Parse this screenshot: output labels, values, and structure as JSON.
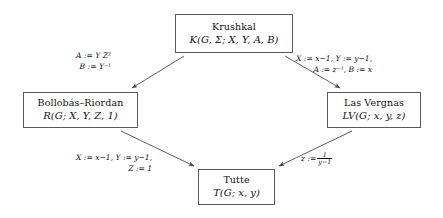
{
  "diagram": {
    "nodes": [
      {
        "id": "krushkal",
        "name": "Krushkal",
        "formula": "K(G, Σ; X, Y, A, B)"
      },
      {
        "id": "bollobas-riordan",
        "name": "Bollobás–Riordan",
        "formula": "R(G; X, Y, Z, 1)"
      },
      {
        "id": "las-vergnas",
        "name": "Las Vergnas",
        "formula": "LV(G; x, y, z)"
      },
      {
        "id": "tutte",
        "name": "Tutte",
        "formula": "T(G; x, y)"
      }
    ],
    "edges": [
      {
        "id": "krushkal-to-bollobas-riordan",
        "from": "krushkal",
        "to": "bollobas-riordan",
        "line1": "A := Y Z²",
        "line2": "B := Y⁻¹"
      },
      {
        "id": "krushkal-to-las-vergnas",
        "from": "krushkal",
        "to": "las-vergnas",
        "line1": "X := x−1,  Y := y−1,",
        "line2": "A := z⁻¹,  B := x"
      },
      {
        "id": "bollobas-riordan-to-tutte",
        "from": "bollobas-riordan",
        "to": "tutte",
        "line1": "X := x−1,  Y := y−1,",
        "line2": "Z := 1"
      },
      {
        "id": "las-vergnas-to-tutte",
        "from": "las-vergnas",
        "to": "tutte",
        "line1_prefix": "z :=",
        "fraction_numerator": "1",
        "fraction_denominator": "y−1"
      }
    ],
    "colors": {
      "background": "#ffffff",
      "box_border": "#5a5a5a",
      "text": "#111111",
      "arrow": "#4a4a4a"
    }
  }
}
